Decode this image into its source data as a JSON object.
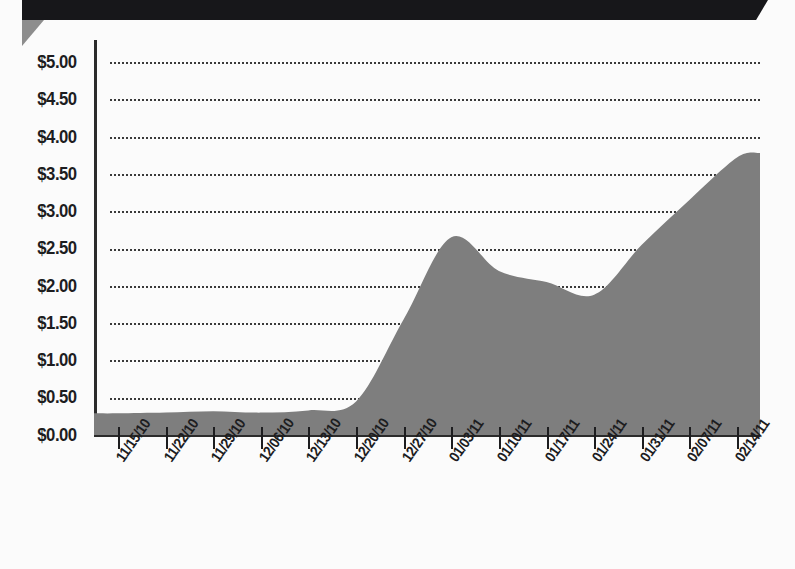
{
  "document": {
    "header_bar_color": "#17171a",
    "fold_color": "#8d8d8d",
    "background_color": "#fbfbfb"
  },
  "chart_data": {
    "type": "area",
    "title": "",
    "subtitle": "",
    "xlabel": "",
    "ylabel": "",
    "series_name": "Price",
    "fill_color": "#7e7e7e",
    "grid": true,
    "grid_style": "dotted",
    "legend": "none",
    "ylim": [
      0,
      5
    ],
    "ytick_labels": [
      "$5.00",
      "$4.50",
      "$4.00",
      "$3.50",
      "$3.00",
      "$2.50",
      "$2.00",
      "$1.50",
      "$1.00",
      "$0.50",
      "$0.00"
    ],
    "ytick_values": [
      5.0,
      4.5,
      4.0,
      3.5,
      3.0,
      2.5,
      2.0,
      1.5,
      1.0,
      0.5,
      0.0
    ],
    "categories": [
      "11/15/10",
      "11/22/10",
      "11/29/10",
      "12/06/10",
      "12/13/10",
      "12/20/10",
      "12/27/10",
      "01/03/11",
      "01/10/11",
      "01/17/11",
      "01/24/11",
      "01/31/11",
      "02/07/11",
      "02/14/11"
    ],
    "values": [
      0.29,
      0.3,
      0.32,
      0.3,
      0.33,
      0.45,
      1.55,
      2.65,
      2.2,
      2.05,
      1.88,
      2.55,
      3.15,
      3.72
    ],
    "annotations": {
      "peak_value": 2.72,
      "peak_near": "01/03/11",
      "trough_value": 1.86,
      "trough_near": "01/24/11",
      "end_value": 3.78
    }
  }
}
